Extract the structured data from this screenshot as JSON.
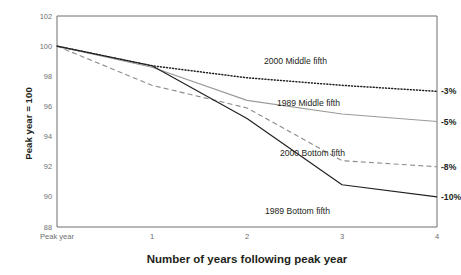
{
  "chart_data": {
    "type": "line",
    "title": "",
    "xlabel": "Number of years following peak year",
    "ylabel": "Peak year = 100",
    "x": [
      0,
      1,
      2,
      3,
      4
    ],
    "categories": [
      "Peak year",
      "1",
      "2",
      "3",
      "4"
    ],
    "xlim": [
      0,
      4
    ],
    "ylim": [
      88,
      102
    ],
    "yticks": [
      88,
      90,
      92,
      94,
      96,
      98,
      100,
      102
    ],
    "grid": false,
    "legend_position": "inline-right",
    "series": [
      {
        "name": "2000 Middle fifth",
        "values": [
          100,
          98.7,
          97.9,
          97.4,
          97.0
        ],
        "style": "dotted",
        "color": "#231f20",
        "end_label": "-3%"
      },
      {
        "name": "1989 Middle fifth",
        "values": [
          100,
          98.6,
          96.4,
          95.5,
          95.0
        ],
        "style": "solid",
        "color": "#9a9a9a",
        "end_label": "-5%"
      },
      {
        "name": "2000 Bottom fifth",
        "values": [
          100,
          97.4,
          95.9,
          92.4,
          92.0
        ],
        "style": "dashed",
        "color": "#8d8d8d",
        "end_label": "-8%"
      },
      {
        "name": "1989 Bottom fifth",
        "values": [
          100,
          98.7,
          95.2,
          90.8,
          90.0
        ],
        "style": "solid",
        "color": "#231f20",
        "end_label": "-10%"
      }
    ],
    "annotations": [
      {
        "text": "2000 Middle fifth",
        "series": "2000 Middle fifth"
      },
      {
        "text": "1989 Middle fifth",
        "series": "1989 Middle fifth"
      },
      {
        "text": "2000 Bottom fifth",
        "series": "2000 Bottom fifth"
      },
      {
        "text": "1989 Bottom fifth",
        "series": "1989 Bottom fifth"
      }
    ]
  },
  "axis": {
    "ytick_labels": [
      "102",
      "100",
      "98",
      "96",
      "94",
      "92",
      "90",
      "88"
    ],
    "xtick_labels": [
      "Peak year",
      "1",
      "2",
      "3",
      "4"
    ]
  },
  "colors": {
    "axis": "#6d6e71",
    "text": "#231f20",
    "tick_text": "#6d6e71",
    "dark_series": "#231f20",
    "gray_series": "#9a9a9a"
  }
}
